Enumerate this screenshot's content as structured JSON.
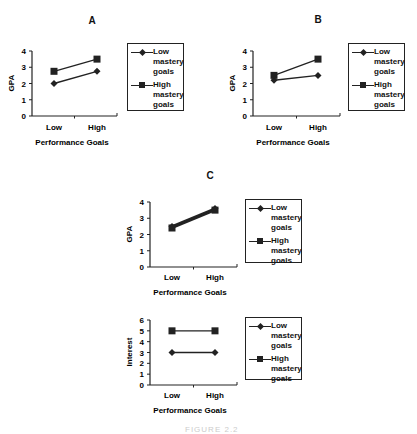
{
  "figure": {
    "caption_partial": "FIGURE 2.2"
  },
  "panels": [
    {
      "id": "A",
      "title": "A",
      "ylabel": "GPA",
      "xlabel": "Performance Goals",
      "yticks": [
        "0",
        "1",
        "2",
        "3",
        "4"
      ],
      "categories": [
        "Low",
        "High"
      ],
      "legend": [
        {
          "label": "Low mastery goals",
          "marker": "diamond"
        },
        {
          "label": "High mastery goals",
          "marker": "square"
        }
      ]
    },
    {
      "id": "B",
      "title": "B",
      "ylabel": "GPA",
      "xlabel": "Performance Goals",
      "yticks": [
        "0",
        "1",
        "2",
        "3",
        "4"
      ],
      "categories": [
        "Low",
        "High"
      ],
      "legend": [
        {
          "label": "Low mastery goals",
          "marker": "diamond"
        },
        {
          "label": "High mastery goals",
          "marker": "square"
        }
      ]
    },
    {
      "id": "C",
      "title": "C",
      "ylabel": "GPA",
      "xlabel": "Performance Goals",
      "yticks": [
        "0",
        "1",
        "2",
        "3",
        "4"
      ],
      "categories": [
        "Low",
        "High"
      ],
      "legend": [
        {
          "label": "Low mastery goals",
          "marker": "diamond"
        },
        {
          "label": "High mastery goals",
          "marker": "square"
        }
      ]
    },
    {
      "id": "C2",
      "title": "",
      "ylabel": "Interest",
      "xlabel": "Performance Goals",
      "yticks": [
        "0",
        "1",
        "2",
        "3",
        "4",
        "5",
        "6"
      ],
      "categories": [
        "Low",
        "High"
      ],
      "legend": [
        {
          "label": "Low mastery goals",
          "marker": "diamond"
        },
        {
          "label": "High mastery goals",
          "marker": "square"
        }
      ]
    }
  ],
  "chart_data": [
    {
      "type": "line",
      "title": "A",
      "xlabel": "Performance Goals",
      "ylabel": "GPA",
      "categories": [
        "Low",
        "High"
      ],
      "ylim": [
        0,
        4
      ],
      "grid": false,
      "legend_position": "right",
      "series": [
        {
          "name": "Low mastery goals",
          "marker": "diamond",
          "values": [
            2.0,
            2.75
          ]
        },
        {
          "name": "High mastery goals",
          "marker": "square",
          "values": [
            2.75,
            3.5
          ]
        }
      ]
    },
    {
      "type": "line",
      "title": "B",
      "xlabel": "Performance Goals",
      "ylabel": "GPA",
      "categories": [
        "Low",
        "High"
      ],
      "ylim": [
        0,
        4
      ],
      "grid": false,
      "legend_position": "right",
      "series": [
        {
          "name": "Low mastery goals",
          "marker": "diamond",
          "values": [
            2.2,
            2.5
          ]
        },
        {
          "name": "High mastery goals",
          "marker": "square",
          "values": [
            2.5,
            3.5
          ]
        }
      ]
    },
    {
      "type": "line",
      "title": "C",
      "xlabel": "Performance Goals",
      "ylabel": "GPA",
      "categories": [
        "Low",
        "High"
      ],
      "ylim": [
        0,
        4
      ],
      "grid": false,
      "legend_position": "right",
      "series": [
        {
          "name": "Low mastery goals",
          "marker": "diamond",
          "values": [
            2.5,
            3.6
          ]
        },
        {
          "name": "High mastery goals",
          "marker": "square",
          "values": [
            2.4,
            3.5
          ]
        }
      ]
    },
    {
      "type": "line",
      "title": "C (Interest)",
      "xlabel": "Performance Goals",
      "ylabel": "Interest",
      "categories": [
        "Low",
        "High"
      ],
      "ylim": [
        0,
        6
      ],
      "grid": false,
      "legend_position": "right",
      "series": [
        {
          "name": "Low mastery goals",
          "marker": "diamond",
          "values": [
            3,
            3
          ]
        },
        {
          "name": "High mastery goals",
          "marker": "square",
          "values": [
            5,
            5
          ]
        }
      ]
    }
  ]
}
